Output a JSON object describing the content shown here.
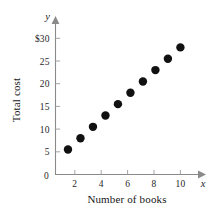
{
  "chart_data": {
    "type": "scatter",
    "title": "",
    "xlabel": "Number of books",
    "ylabel": "Total cost",
    "x_axis_variable": "x",
    "y_axis_variable": "y",
    "xlim": [
      0,
      11
    ],
    "ylim": [
      0,
      31
    ],
    "grid": false,
    "legend": null,
    "x_ticks": [
      {
        "value": 0,
        "label": "0"
      },
      {
        "value": 2,
        "label": "2"
      },
      {
        "value": 4,
        "label": "4"
      },
      {
        "value": 6,
        "label": "6"
      },
      {
        "value": 8,
        "label": "8"
      },
      {
        "value": 10,
        "label": "10"
      }
    ],
    "y_ticks": [
      {
        "value": 0,
        "label": "0"
      },
      {
        "value": 5,
        "label": "5"
      },
      {
        "value": 10,
        "label": "10"
      },
      {
        "value": 15,
        "label": "15"
      },
      {
        "value": 20,
        "label": "20"
      },
      {
        "value": 25,
        "label": "25"
      },
      {
        "value": 30,
        "label": "$30"
      }
    ],
    "x": [
      1,
      2,
      3,
      4,
      5,
      6,
      7,
      8,
      9,
      10
    ],
    "values": [
      5.5,
      8,
      10.5,
      13,
      15.5,
      18,
      20.5,
      23,
      25.5,
      28
    ],
    "points": [
      {
        "x": 1,
        "y": 5.5
      },
      {
        "x": 2,
        "y": 8
      },
      {
        "x": 3,
        "y": 10.5
      },
      {
        "x": 4,
        "y": 13
      },
      {
        "x": 5,
        "y": 15.5
      },
      {
        "x": 6,
        "y": 18
      },
      {
        "x": 7,
        "y": 20.5
      },
      {
        "x": 8,
        "y": 23
      },
      {
        "x": 9,
        "y": 25.5
      },
      {
        "x": 10,
        "y": 28
      }
    ],
    "marker": {
      "shape": "circle",
      "color": "#111111",
      "size_px": 4.2
    },
    "axis_color": "#8a8a8a"
  }
}
